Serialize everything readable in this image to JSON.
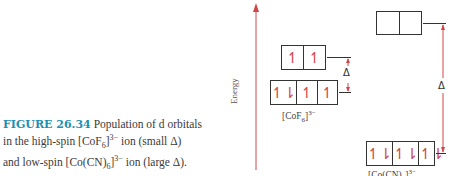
{
  "caption": {
    "figure_label": "FIGURE 26.34",
    "line1": "Population of d orbitals",
    "line2_pre": "in the high-spin [CoF",
    "line2_sub": "6",
    "line2_post": "]",
    "line2_sup": "3−",
    "line2_end": " ion (small Δ)",
    "line3_pre": "and low-spin [Co(CN)",
    "line3_sub": "6",
    "line3_post": "]",
    "line3_sup": "3−",
    "line3_end": " ion (large Δ)."
  },
  "diagram": {
    "axis_label": "Energy",
    "accent_color": "#d2464a",
    "complexes": [
      {
        "name_pre": "[CoF",
        "name_sub": "6",
        "name_post": "]",
        "name_sup": "3−",
        "eg": [
          "↿",
          "↿"
        ],
        "t2g": [
          "↿⇂",
          "↿",
          "↿"
        ],
        "gap_label": "Δ",
        "gap_size": "small"
      },
      {
        "name_pre": "[Co(CN)",
        "name_sub": "6",
        "name_post": "]",
        "name_sup": "3−",
        "eg": [
          "",
          ""
        ],
        "t2g": [
          "↿⇂",
          "↿⇂",
          "↿⇂"
        ],
        "gap_label": "Δ",
        "gap_size": "large"
      }
    ]
  }
}
